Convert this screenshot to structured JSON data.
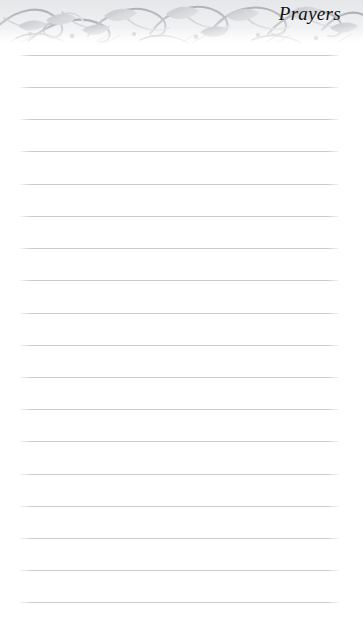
{
  "page": {
    "width": 363,
    "height": 628,
    "background_color": "#ffffff",
    "kind": "lined-journal-page"
  },
  "header": {
    "title": "Prayers",
    "ornament_name": "floral-scroll-border",
    "ornament_color": "#b9bcc0",
    "ornament_height_px": 48
  },
  "rules": {
    "count": 18,
    "first_line_y": 55,
    "spacing_px": 32.2,
    "left_x": 20,
    "right_x": 339,
    "color": "#c9c9ce",
    "lines": [
      {
        "index": 1,
        "y": 55,
        "text": ""
      },
      {
        "index": 2,
        "y": 87,
        "text": ""
      },
      {
        "index": 3,
        "y": 119,
        "text": ""
      },
      {
        "index": 4,
        "y": 151,
        "text": ""
      },
      {
        "index": 5,
        "y": 184,
        "text": ""
      },
      {
        "index": 6,
        "y": 216,
        "text": ""
      },
      {
        "index": 7,
        "y": 248,
        "text": ""
      },
      {
        "index": 8,
        "y": 280,
        "text": ""
      },
      {
        "index": 9,
        "y": 313,
        "text": ""
      },
      {
        "index": 10,
        "y": 345,
        "text": ""
      },
      {
        "index": 11,
        "y": 377,
        "text": ""
      },
      {
        "index": 12,
        "y": 409,
        "text": ""
      },
      {
        "index": 13,
        "y": 441,
        "text": ""
      },
      {
        "index": 14,
        "y": 474,
        "text": ""
      },
      {
        "index": 15,
        "y": 506,
        "text": ""
      },
      {
        "index": 16,
        "y": 538,
        "text": ""
      },
      {
        "index": 17,
        "y": 570,
        "text": ""
      },
      {
        "index": 18,
        "y": 602,
        "text": ""
      }
    ]
  }
}
